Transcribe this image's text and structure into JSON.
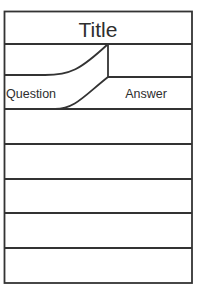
{
  "card": {
    "title": "Title",
    "header_row": {
      "question_label": "Question",
      "answer_label": "Answer"
    },
    "empty_rows": 5
  },
  "colors": {
    "line": "#333333",
    "text": "#2e2e2e",
    "background": "#ffffff"
  }
}
